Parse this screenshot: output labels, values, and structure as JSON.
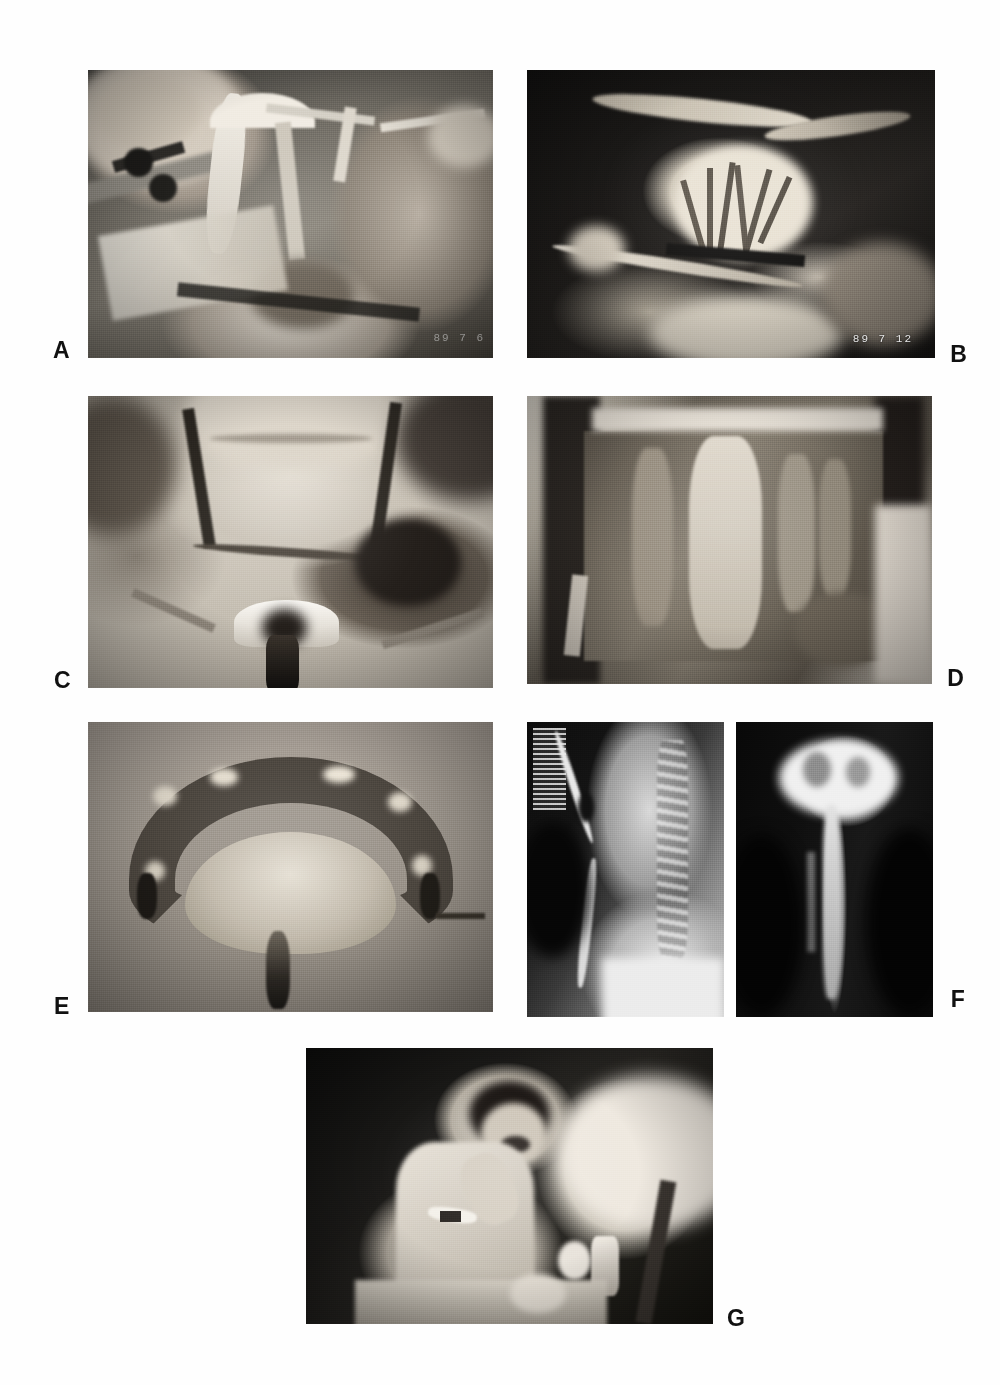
{
  "figure": {
    "type": "multi-panel-photographic-figure",
    "panel_count": 7,
    "background_color": "#ffffff",
    "label_color": "#111111",
    "rendering": "grayscale halftone print reproduction"
  },
  "panels": [
    {
      "id": "a",
      "label": "A",
      "label_position": "left-outside-bottom",
      "caption_text": "",
      "content_description": "Intraoperative photograph of an open neck surgical field with retractors, hemostat, suction tubing and gloved surgeon's fingers.",
      "modality": "clinical-photograph",
      "datestamp": "89  7  6",
      "datestamp_visible": true
    },
    {
      "id": "b",
      "label": "B",
      "label_position": "right-outside-bottom",
      "caption_text": "",
      "content_description": "Intraoperative photograph showing a translucent bowel mesentery with an arborizing vascular arcade, held by a surgical clamp against a dark drape.",
      "modality": "clinical-photograph",
      "datestamp": "89  7  12",
      "datestamp_visible": true
    },
    {
      "id": "c",
      "label": "C",
      "label_position": "left-outside-bottom",
      "caption_text": "",
      "content_description": "Postoperative anterior neck photograph showing a sutured transverse cervical incision, an indwelling tracheostomy tube with flange, and a lateral stoma.",
      "modality": "clinical-photograph",
      "datestamp": "",
      "datestamp_visible": false
    },
    {
      "id": "d",
      "label": "D",
      "label_position": "right-outside-bottom",
      "caption_text": "",
      "content_description": "Intraoperative abdominal photograph of an open laparotomy field with exposed viscera surrounded by surgical towels and retracted skin edges.",
      "modality": "clinical-photograph",
      "datestamp": "",
      "datestamp_visible": false
    },
    {
      "id": "e",
      "label": "E",
      "label_position": "left-outside-bottom",
      "caption_text": "",
      "content_description": "Gross specimen photograph of an isolated U-shaped bowel (colon) segment with its fan-shaped mesenteric pedicle and vascular stalk, laid on a plain background.",
      "modality": "gross-specimen-photograph",
      "datestamp": "",
      "datestamp_visible": false
    },
    {
      "id": "f",
      "label": "F",
      "label_position": "right-outside-bottom",
      "caption_text": "",
      "content_description": "Two contrast swallow radiographs shown side by side: a lateral cervical view showing the contrast column anterior to the cervical spine, and a frontal (AP) view showing contrast in the reconstructed conduit.",
      "modality": "radiograph",
      "sub_images": [
        {
          "view": "lateral",
          "description": "Lateral neck contrast study with film identification marker at upper left and cervical vertebrae visible."
        },
        {
          "view": "anteroposterior",
          "description": "Frontal contrast study showing opacified pharyngeal pouch and descending conduit."
        }
      ],
      "datestamp": "",
      "datestamp_visible": false
    },
    {
      "id": "g",
      "label": "G",
      "label_position": "right-outside-bottom",
      "caption_text": "",
      "content_description": "Postoperative photograph of a male patient in a hospital bed wearing a hospital gown and a wrist identification band, feeding himself by mouth from a meal tray with a cup and a bottle.",
      "modality": "clinical-photograph",
      "datestamp": "",
      "datestamp_visible": false
    }
  ]
}
